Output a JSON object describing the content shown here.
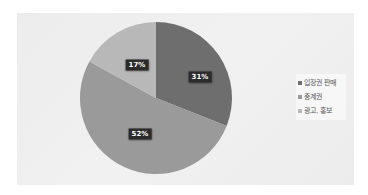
{
  "chart_data": {
    "type": "pie",
    "title": "",
    "categories": [
      "입장권 판매",
      "중계권",
      "광고, 홍보"
    ],
    "values": [
      31,
      52,
      17
    ],
    "labels": [
      "31%",
      "52%",
      "17%"
    ],
    "colors": [
      "#6e6e6e",
      "#9a9a9a",
      "#b8b8b8"
    ],
    "start_angle_deg": 0,
    "direction": "clockwise",
    "legend_position": "right",
    "data_labels_shown": true
  },
  "legend": {
    "items": [
      {
        "label": "입장권 판매",
        "color": "#6e6e6e"
      },
      {
        "label": "중계권",
        "color": "#9a9a9a"
      },
      {
        "label": "광고, 홍보",
        "color": "#b8b8b8"
      }
    ]
  },
  "data_labels": {
    "slice0": "31%",
    "slice1": "52%",
    "slice2": "17%"
  }
}
